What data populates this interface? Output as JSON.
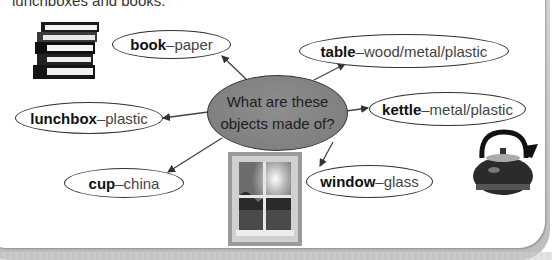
{
  "intro": {
    "text": "lunchboxes and books."
  },
  "center": {
    "line1": "What are these",
    "line2": "objects made of?"
  },
  "items": [
    {
      "object": "book",
      "separator": " – ",
      "material": "paper"
    },
    {
      "object": "table",
      "separator": " – ",
      "material": "wood/metal/plastic"
    },
    {
      "object": "kettle",
      "separator": " – ",
      "material": "metal/plastic"
    },
    {
      "object": "lunchbox",
      "separator": " – ",
      "material": "plastic"
    },
    {
      "object": "cup",
      "separator": " – ",
      "material": "china"
    },
    {
      "object": "window",
      "separator": " – ",
      "material": "glass"
    }
  ],
  "images": {
    "books": "stack-of-books",
    "window": "window-photo",
    "kettle": "kettle"
  },
  "colors": {
    "center_fill": "#838383",
    "outline": "#333333",
    "frame": "#c4c4c4"
  }
}
